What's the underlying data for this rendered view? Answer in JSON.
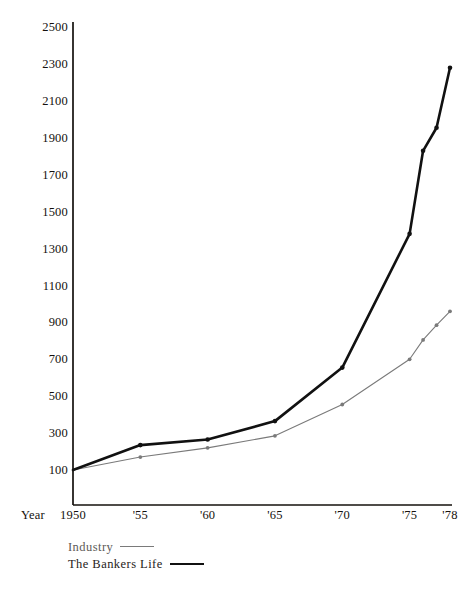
{
  "chart_data": {
    "type": "line",
    "title": "",
    "subtitle": "",
    "xlabel": "Year",
    "ylabel": "Percent of Base Year 1950",
    "x": [
      1950,
      1955,
      1960,
      1965,
      1970,
      1975,
      1976,
      1977,
      1978
    ],
    "tick_labels_x": [
      "1950",
      "'55",
      "'60",
      "'65",
      "'70",
      "'75",
      "'78"
    ],
    "tick_values_x": [
      1950,
      1955,
      1960,
      1965,
      1970,
      1975,
      1978
    ],
    "tick_labels_y": [
      "100",
      "300",
      "500",
      "700",
      "900",
      "1100",
      "1300",
      "1500",
      "1700",
      "1900",
      "2100",
      "2300",
      "2500"
    ],
    "tick_values_y": [
      100,
      300,
      500,
      700,
      900,
      1100,
      1300,
      1500,
      1700,
      1900,
      2100,
      2300,
      2500
    ],
    "xlim": [
      1950,
      1978
    ],
    "ylim": [
      100,
      2500
    ],
    "grid": false,
    "legend_position": "below-left",
    "series": [
      {
        "name": "Industry",
        "color": "#7a7a7a",
        "line_width": 1.1,
        "x": [
          1950,
          1955,
          1960,
          1965,
          1970,
          1975,
          1976,
          1977,
          1978
        ],
        "values": [
          100,
          170,
          220,
          285,
          455,
          700,
          805,
          885,
          960
        ]
      },
      {
        "name": "The Bankers Life",
        "color": "#111111",
        "line_width": 2.6,
        "x": [
          1950,
          1955,
          1960,
          1965,
          1970,
          1975,
          1976,
          1977,
          1978
        ],
        "values": [
          100,
          235,
          265,
          365,
          655,
          1380,
          1830,
          1955,
          2280
        ]
      }
    ]
  },
  "axes": {
    "y_title": "Percent of Base Year 1950",
    "x_title": "Year"
  },
  "legend": {
    "items": [
      {
        "label": "Industry",
        "style": "thin"
      },
      {
        "label": "The Bankers Life",
        "style": "thick"
      }
    ]
  }
}
